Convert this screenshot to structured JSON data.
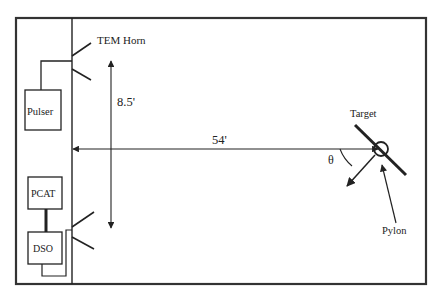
{
  "diagram": {
    "type": "measurement-setup",
    "labels": {
      "tem_horn": "TEM Horn",
      "pulser": "Pulser",
      "pcat": "PCAT",
      "dso": "DSO",
      "height_dimension": "8.5'",
      "distance_dimension": "54'",
      "angle": "θ",
      "target": "Target",
      "pylon": "Pylon"
    },
    "colors": {
      "line": "#222222",
      "frame": "#333333",
      "background": "#ffffff"
    }
  }
}
